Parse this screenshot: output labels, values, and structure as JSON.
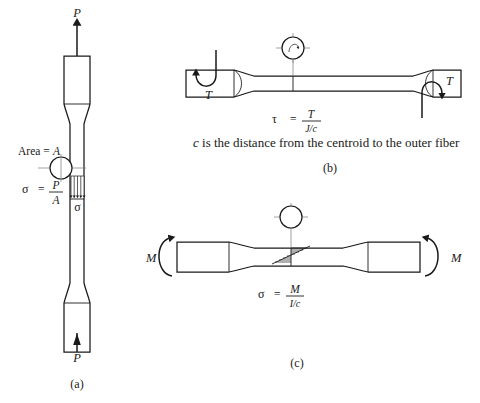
{
  "figure": {
    "background_color": "#ffffff",
    "line_color": "#1a1a1a",
    "centerline_color": "#7a7a7a"
  },
  "panel_a": {
    "panel_label": "(a)",
    "force_top_label": "P",
    "force_bottom_label": "P",
    "area_label": "Area =",
    "area_symbol": "A",
    "stress_symbol": "σ",
    "equals": "=",
    "numerator": "P",
    "denominator": "A",
    "distribution_label": "σ",
    "section_icon": "circular-cross-section-icon"
  },
  "panel_b": {
    "panel_label": "(b)",
    "torque_left_label": "T",
    "torque_right_label": "T",
    "stress_symbol": "τ",
    "equals": "=",
    "numerator": "T",
    "denominator": "J/c",
    "note": "c is the distance from the centroid to the outer fiber",
    "note_lead_italic": "c",
    "note_rest": " is the distance from the centroid to the outer fiber",
    "section_icon": "torsion-cross-section-icon"
  },
  "panel_c": {
    "panel_label": "(c)",
    "moment_left_label": "M",
    "moment_right_label": "M",
    "stress_symbol": "σ",
    "equals": "=",
    "numerator": "M",
    "denominator": "I/c",
    "section_icon": "bending-cross-section-icon"
  }
}
